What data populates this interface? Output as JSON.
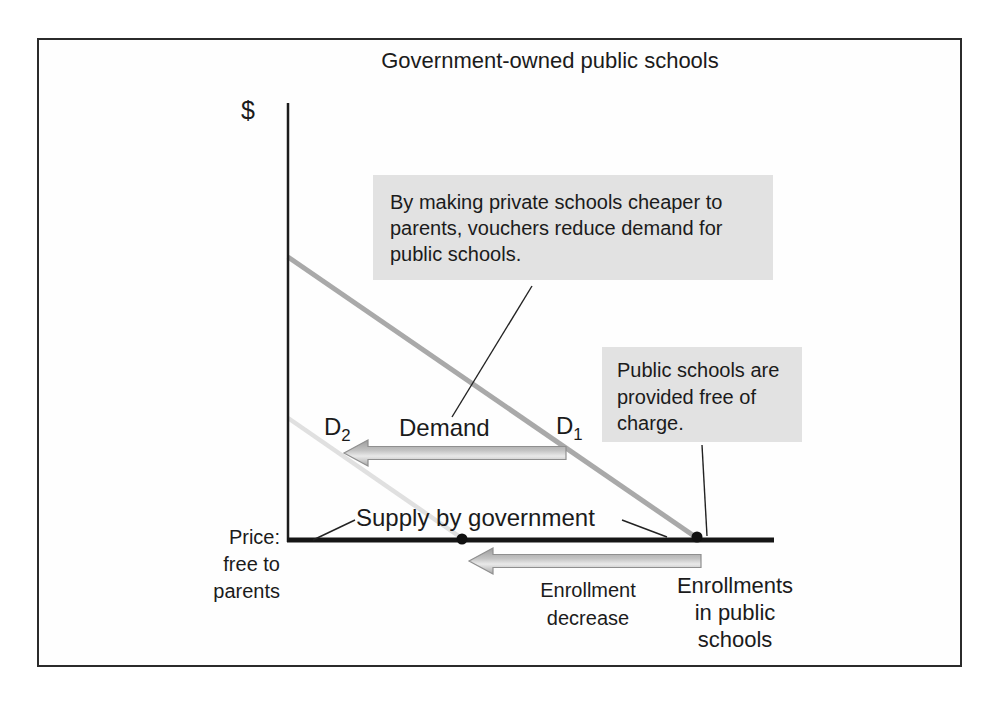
{
  "figure": {
    "title": "Government-owned public schools"
  },
  "axes": {
    "y_axis_label": "$",
    "price_note_lines": [
      "Price:",
      "free to",
      "parents"
    ],
    "x_axis_label_lines": [
      "Enrollments",
      "in public",
      "schools"
    ]
  },
  "curves": {
    "demand_label": "Demand",
    "d1": {
      "base": "D",
      "sub": "1"
    },
    "d2": {
      "base": "D",
      "sub": "2"
    },
    "supply_label": "Supply by government"
  },
  "annotations": {
    "voucher_callout_lines": [
      "By making private schools cheaper to",
      "parents, vouchers reduce demand for",
      "public schools."
    ],
    "free_callout_lines": [
      "Public schools are",
      "provided free of",
      "charge."
    ],
    "enrollment_arrow_lines": [
      "Enrollment",
      "decrease"
    ]
  },
  "colors": {
    "axis": "#1c1c1c",
    "d1_line": "#a9a9a9",
    "d2_line": "#e0e0e0",
    "callout_bg": "#e2e2e2",
    "arrow_fill": "#bdbdbd",
    "arrow_border": "#8f8f8f"
  }
}
